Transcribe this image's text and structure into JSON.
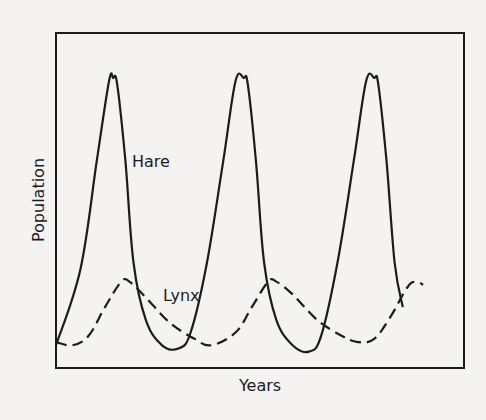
{
  "chart_data": {
    "type": "line",
    "title": "",
    "xlabel": "Years",
    "ylabel": "Population",
    "grid": false,
    "legend": "inline labels",
    "x_ticks": [],
    "y_ticks": [],
    "xlim": [
      0,
      100
    ],
    "ylim": [
      0,
      100
    ],
    "series": [
      {
        "name": "Hare",
        "style": "solid",
        "color": "#1c1c1c",
        "label_pos": [
          75,
          66
        ],
        "points": [
          [
            0,
            4
          ],
          [
            6,
            28
          ],
          [
            10,
            62
          ],
          [
            13,
            87
          ],
          [
            14,
            88
          ],
          [
            15,
            86
          ],
          [
            17,
            62
          ],
          [
            19,
            30
          ],
          [
            22,
            12
          ],
          [
            26,
            4
          ],
          [
            30,
            3
          ],
          [
            33,
            8
          ],
          [
            37,
            30
          ],
          [
            41,
            62
          ],
          [
            44,
            87
          ],
          [
            46,
            88
          ],
          [
            47,
            86
          ],
          [
            49,
            62
          ],
          [
            51,
            30
          ],
          [
            54,
            12
          ],
          [
            58,
            4
          ],
          [
            62,
            2
          ],
          [
            65,
            7
          ],
          [
            69,
            30
          ],
          [
            73,
            62
          ],
          [
            76,
            87
          ],
          [
            78,
            88
          ],
          [
            79,
            86
          ],
          [
            81,
            62
          ],
          [
            83,
            30
          ],
          [
            85,
            16
          ]
        ]
      },
      {
        "name": "Lynx",
        "style": "dashed",
        "color": "#1c1c1c",
        "label_pos": [
          30,
          22
        ],
        "points": [
          [
            0,
            5
          ],
          [
            4,
            4
          ],
          [
            8,
            7
          ],
          [
            12,
            16
          ],
          [
            16,
            24
          ],
          [
            18,
            24
          ],
          [
            22,
            19
          ],
          [
            28,
            11
          ],
          [
            34,
            6
          ],
          [
            38,
            4
          ],
          [
            44,
            8
          ],
          [
            48,
            16
          ],
          [
            52,
            24
          ],
          [
            54,
            24
          ],
          [
            58,
            20
          ],
          [
            64,
            12
          ],
          [
            70,
            7
          ],
          [
            74,
            5
          ],
          [
            78,
            6
          ],
          [
            82,
            13
          ],
          [
            86,
            22
          ],
          [
            88,
            24
          ],
          [
            90,
            23
          ]
        ]
      }
    ]
  },
  "plot": {
    "x_axis_label": "Years",
    "y_axis_label": "Population",
    "hare_label": "Hare",
    "lynx_label": "Lynx"
  },
  "colors": {
    "background": "#f4f3f1",
    "ink": "#1c1c1c"
  }
}
